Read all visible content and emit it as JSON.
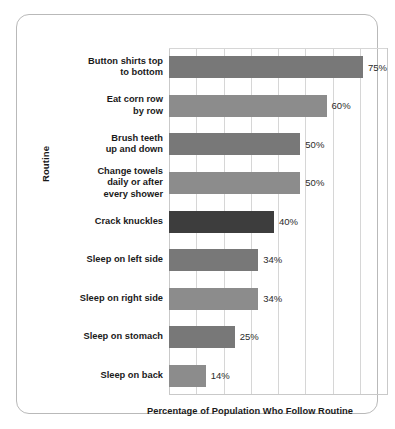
{
  "chart_data": {
    "type": "bar",
    "orientation": "horizontal",
    "title": "",
    "xlabel": "Percentage of Population Who Follow Routine",
    "ylabel": "Routine",
    "xlim": [
      0,
      83
    ],
    "grid": true,
    "gridline_values": [
      0,
      10.4,
      20.8,
      31.1,
      41.5,
      51.9,
      62.3,
      72.6,
      83
    ],
    "legend": "none",
    "categories": [
      "Button shirts top\nto bottom",
      "Eat corn row\nby row",
      "Brush teeth\nup and down",
      "Change towels\ndaily or after\nevery shower",
      "Crack knuckles",
      "Sleep on left side",
      "Sleep on right side",
      "Sleep on stomach",
      "Sleep on back"
    ],
    "values": [
      75,
      60,
      50,
      50,
      40,
      34,
      34,
      25,
      14
    ],
    "value_labels": [
      "75%",
      "60%",
      "50%",
      "50%",
      "40%",
      "34%",
      "34%",
      "25%",
      "14%"
    ],
    "bar_colors": [
      "#787878",
      "#8c8c8c",
      "#787878",
      "#8c8c8c",
      "#3d3d3d",
      "#787878",
      "#8c8c8c",
      "#787878",
      "#8c8c8c"
    ],
    "highlight_index": 4,
    "highlight_color": "#3d3d3d",
    "default_color": "#808080"
  },
  "frame": {
    "border_color": "#b9b9b9",
    "background": "#ffffff"
  },
  "top_caption": ""
}
